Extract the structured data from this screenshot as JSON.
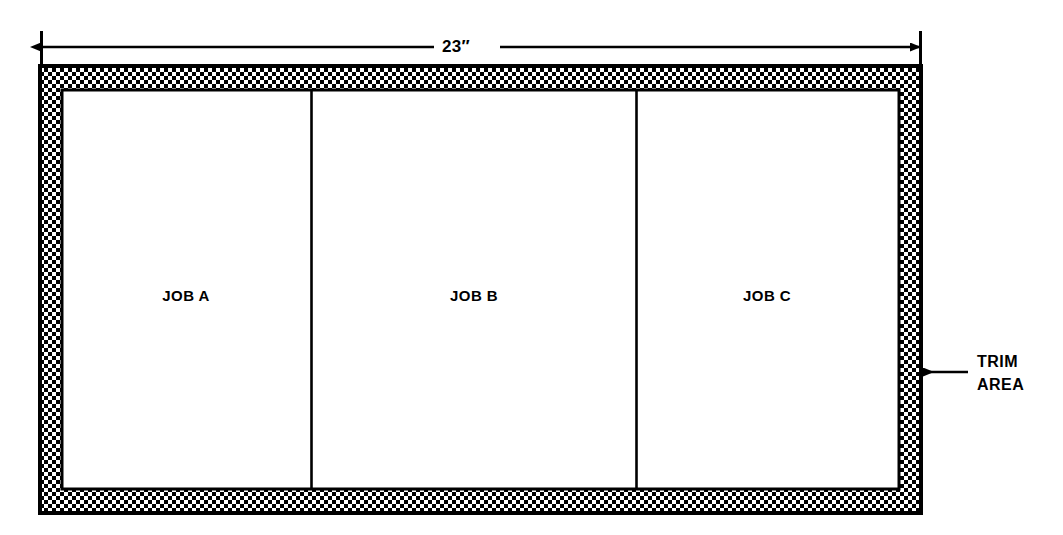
{
  "diagram": {
    "dimension": {
      "label": "23″",
      "value": 23,
      "unit": "inch",
      "orientation": "horizontal",
      "spans": "full sheet width"
    },
    "sheet": {
      "trim_pattern": "checkerboard-halftone",
      "outline_color": "#000000",
      "fill_color": "#ffffff"
    },
    "panels": [
      {
        "label": "JOB A"
      },
      {
        "label": "JOB B"
      },
      {
        "label": "JOB C"
      }
    ],
    "callout": {
      "line1": "TRIM",
      "line2": "AREA",
      "points_to": "trim-border"
    }
  }
}
